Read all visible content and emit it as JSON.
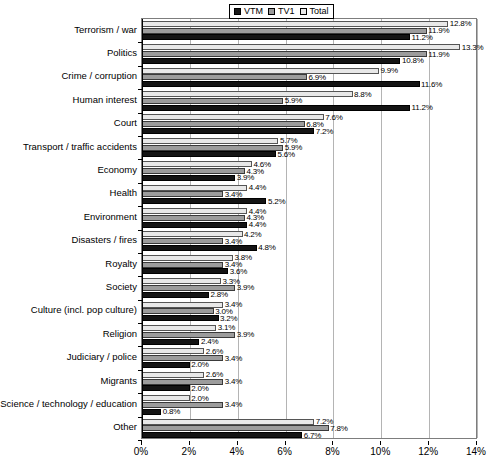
{
  "chart": {
    "type": "bar",
    "orientation": "horizontal",
    "title": "",
    "xlabel": "",
    "ylabel": "",
    "grid": true,
    "legend_position": "top-center"
  },
  "legend": {
    "entries": [
      {
        "label": "VTM",
        "color": "#141414",
        "icon": "square-swatch-icon"
      },
      {
        "label": "TV1",
        "color": "#9c9c9c",
        "icon": "square-swatch-icon"
      },
      {
        "label": "Total",
        "color": "#e8e8e8",
        "icon": "square-swatch-icon"
      }
    ]
  },
  "xaxis": {
    "ticks": [
      "0%",
      "2%",
      "4%",
      "6%",
      "8%",
      "10%",
      "12%",
      "14%"
    ],
    "values": [
      0,
      2,
      4,
      6,
      8,
      10,
      12,
      14
    ],
    "min": 0,
    "max": 14
  },
  "chart_data": {
    "type": "bar",
    "orientation": "horizontal",
    "title": "",
    "xlabel": "",
    "ylabel": "",
    "xlim": [
      0,
      14
    ],
    "grid": true,
    "legend_position": "top-center",
    "categories": [
      "Terrorism / war",
      "Politics",
      "Crime / corruption",
      "Human interest",
      "Court",
      "Transport / traffic accidents",
      "Economy",
      "Health",
      "Environment",
      "Disasters / fires",
      "Royalty",
      "Society",
      "Culture (incl. pop culture)",
      "Religion",
      "Judiciary / police",
      "Migrants",
      "Science / technology / education",
      "Other"
    ],
    "series": [
      {
        "name": "Total",
        "color": "#e8e8e8",
        "values": [
          12.8,
          13.3,
          9.9,
          8.8,
          7.6,
          5.7,
          4.6,
          4.4,
          4.4,
          4.2,
          3.8,
          3.3,
          3.4,
          3.1,
          2.6,
          2.6,
          2.0,
          7.2
        ],
        "labels": [
          "12.8%",
          "13.3%",
          "9.9%",
          "8.8%",
          "7.6%",
          "5.7%",
          "4.6%",
          "4.4%",
          "4.4%",
          "4.2%",
          "3.8%",
          "3.3%",
          "3.4%",
          "3.1%",
          "2.6%",
          "2.6%",
          "2.0%",
          "7.2%"
        ]
      },
      {
        "name": "TV1",
        "color": "#9c9c9c",
        "values": [
          11.9,
          11.9,
          6.9,
          5.9,
          6.8,
          5.9,
          4.3,
          3.4,
          4.3,
          3.4,
          3.4,
          3.9,
          3.0,
          3.9,
          3.4,
          3.4,
          3.4,
          7.8
        ],
        "labels": [
          "11.9%",
          "11.9%",
          "6.9%",
          "5.9%",
          "6.8%",
          "5.9%",
          "4.3%",
          "3.4%",
          "4.3%",
          "3.4%",
          "3.4%",
          "3.9%",
          "3.0%",
          "3.9%",
          "3.4%",
          "3.4%",
          "3.4%",
          "7.8%"
        ]
      },
      {
        "name": "VTM",
        "color": "#141414",
        "values": [
          11.2,
          10.8,
          11.6,
          11.2,
          7.2,
          5.6,
          3.9,
          5.2,
          4.4,
          4.8,
          3.6,
          2.8,
          3.2,
          2.4,
          2.0,
          2.0,
          0.8,
          6.7
        ],
        "labels": [
          "11.2%",
          "10.8%",
          "11.6%",
          "11.2%",
          "7.2%",
          "5.6%",
          "3.9%",
          "5.2%",
          "4.4%",
          "4.8%",
          "3.6%",
          "2.8%",
          "3.2%",
          "2.4%",
          "2.0%",
          "2.0%",
          "0.8%",
          "6.7%"
        ]
      }
    ]
  }
}
